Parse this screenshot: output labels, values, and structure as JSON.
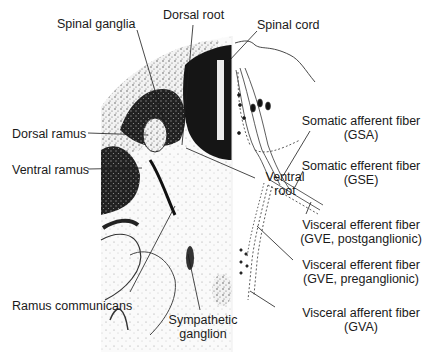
{
  "diagram": {
    "type": "anatomical-cross-section",
    "labels": {
      "spinal_ganglia": "Spinal ganglia",
      "dorsal_root": "Dorsal root",
      "spinal_cord": "Spinal cord",
      "dorsal_ramus": "Dorsal ramus",
      "ventral_ramus": "Ventral ramus",
      "ventral_root_line1": "Ventral",
      "ventral_root_line2": "root",
      "gsa_line1": "Somatic afferent fiber",
      "gsa_line2": "(GSA)",
      "gse_line1": "Somatic efferent fiber",
      "gse_line2": "(GSE)",
      "gve_post_line1": "Visceral efferent fiber",
      "gve_post_line2": "(GVE, postganglionic)",
      "gve_pre_line1": "Visceral efferent fiber",
      "gve_pre_line2": "(GVE, preganglionic)",
      "gva_line1": "Visceral afferent fiber",
      "gva_line2": "(GVA)",
      "ramus_communicans": "Ramus communicans",
      "sympathetic_line1": "Sympathetic",
      "sympathetic_line2": "ganglion"
    },
    "colors": {
      "ink": "#1a1a1a",
      "tissue_dark": "#111111",
      "tissue_mid": "#555555",
      "tissue_light": "#bdbdbd",
      "background": "#ffffff"
    }
  }
}
